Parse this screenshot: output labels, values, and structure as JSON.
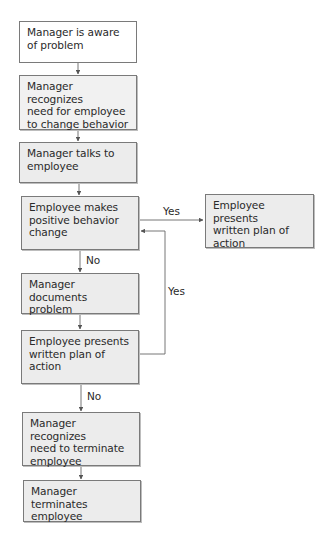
{
  "diagram": {
    "type": "flowchart",
    "nodes": [
      {
        "id": "n1",
        "text": "Manager is aware of problem",
        "lines": [
          "Manager is aware",
          "of problem"
        ]
      },
      {
        "id": "n2",
        "text": "Manager recognizes need for employee to change behavior",
        "lines": [
          "Manager recognizes",
          "need for employee",
          "to change behavior"
        ]
      },
      {
        "id": "n3",
        "text": "Manager talks to employee",
        "lines": [
          "Manager talks to",
          "employee"
        ]
      },
      {
        "id": "n4",
        "text": "Employee makes positive behavior change",
        "lines": [
          "Employee makes",
          "positive behavior",
          "change"
        ]
      },
      {
        "id": "n4r",
        "text": "Employee presents written plan of action",
        "lines": [
          "Employee presents",
          "written plan of",
          "action"
        ]
      },
      {
        "id": "n5",
        "text": "Manager documents problem",
        "lines": [
          "Manager documents",
          "problem"
        ]
      },
      {
        "id": "n6",
        "text": "Employee presents written plan of action",
        "lines": [
          "Employee presents",
          "written plan of",
          "action"
        ]
      },
      {
        "id": "n7",
        "text": "Manager recognizes need to terminate employee",
        "lines": [
          "Manager recognizes",
          "need to terminate",
          "employee"
        ]
      },
      {
        "id": "n8",
        "text": "Manager terminates employee",
        "lines": [
          "Manager terminates",
          "employee"
        ]
      }
    ],
    "edges": [
      {
        "from": "n1",
        "to": "n2",
        "label": ""
      },
      {
        "from": "n2",
        "to": "n3",
        "label": ""
      },
      {
        "from": "n3",
        "to": "n4",
        "label": ""
      },
      {
        "from": "n4",
        "to": "n4r",
        "label": "Yes"
      },
      {
        "from": "n4",
        "to": "n5",
        "label": "No"
      },
      {
        "from": "n5",
        "to": "n6",
        "label": ""
      },
      {
        "from": "n6",
        "to": "n4",
        "label": "Yes"
      },
      {
        "from": "n6",
        "to": "n7",
        "label": "No"
      },
      {
        "from": "n7",
        "to": "n8",
        "label": ""
      }
    ],
    "edge_labels": {
      "yes_right": "Yes",
      "no_1": "No",
      "yes_loop": "Yes",
      "no_2": "No"
    },
    "colors": {
      "box_fill": "#ececec",
      "box_fill_first": "#ffffff",
      "border": "#7a7a7a",
      "line": "#555555",
      "text": "#2a2a2a"
    }
  }
}
